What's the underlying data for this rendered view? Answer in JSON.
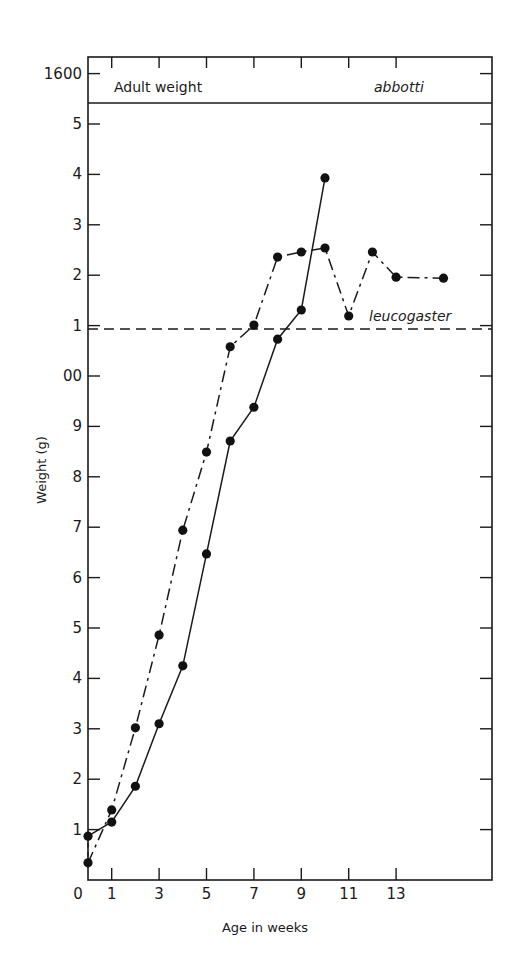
{
  "chart_data": {
    "type": "line",
    "title": "",
    "xlabel": "Age in weeks",
    "ylabel": "Weight (g)",
    "xlim": [
      0,
      18.9
    ],
    "ylim": [
      0,
      1645
    ],
    "grid": false,
    "x_ticks": [
      {
        "value": 0,
        "label": "0"
      },
      {
        "value": 1,
        "label": "1"
      },
      {
        "value": 3,
        "label": "3"
      },
      {
        "value": 5,
        "label": "5"
      },
      {
        "value": 7,
        "label": "7"
      },
      {
        "value": 9,
        "label": "9"
      },
      {
        "value": 11,
        "label": "11"
      },
      {
        "value": 13,
        "label": "13"
      }
    ],
    "y_ticks": [
      {
        "value": 100,
        "label": "1"
      },
      {
        "value": 200,
        "label": "2"
      },
      {
        "value": 300,
        "label": "3"
      },
      {
        "value": 400,
        "label": "4"
      },
      {
        "value": 500,
        "label": "5"
      },
      {
        "value": 600,
        "label": "6"
      },
      {
        "value": 700,
        "label": "7"
      },
      {
        "value": 800,
        "label": "8"
      },
      {
        "value": 900,
        "label": "9"
      },
      {
        "value": 1000,
        "label": "00"
      },
      {
        "value": 1100,
        "label": "1"
      },
      {
        "value": 1200,
        "label": "2"
      },
      {
        "value": 1300,
        "label": "3"
      },
      {
        "value": 1400,
        "label": "4"
      },
      {
        "value": 1500,
        "label": "5"
      },
      {
        "value": 1600,
        "label": "1600"
      }
    ],
    "series": [
      {
        "name": "dashed-dot series",
        "style": "dash-dot",
        "marker": "filled-circle",
        "x": [
          0,
          1,
          2,
          3,
          4,
          5,
          6,
          7,
          8,
          9,
          10,
          11,
          12,
          13,
          15
        ],
        "values": [
          34,
          139,
          302,
          486,
          694,
          849,
          1058,
          1101,
          1236,
          1246,
          1254,
          1119,
          1246,
          1196,
          1194
        ]
      },
      {
        "name": "solid series",
        "style": "solid",
        "marker": "filled-circle",
        "x": [
          0,
          1,
          2,
          3,
          4,
          5,
          6,
          7,
          8,
          9,
          10
        ],
        "values": [
          87,
          115,
          186,
          310,
          425,
          647,
          871,
          938,
          1073,
          1131,
          1393
        ]
      }
    ],
    "reference_lines": [
      {
        "label": "leucogaster",
        "value": 1100,
        "style": "dashed",
        "orientation": "horizontal"
      },
      {
        "label": "abbotti",
        "value": 1545,
        "style": "solid",
        "orientation": "horizontal",
        "note": "Adult weight band boundary"
      }
    ],
    "annotations": [
      {
        "text": "Adult weight",
        "position": "top-left band"
      },
      {
        "text": "abbotti",
        "position": "top-right band",
        "italic": true
      },
      {
        "text": "leucogaster",
        "position": "above dashed line, right",
        "italic": true
      }
    ],
    "legend": null
  },
  "labels": {
    "xlabel": "Age in weeks",
    "ylabel": "Weight (g)",
    "adult_weight": "Adult weight",
    "abbotti": "abbotti",
    "leucogaster": "leucogaster",
    "x_zero": "0"
  }
}
